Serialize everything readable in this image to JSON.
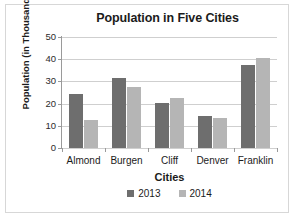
{
  "chart_data": {
    "type": "bar",
    "title": "Population in Five Cities",
    "xlabel": "Cities",
    "ylabel": "Population (in Thousands)",
    "categories": [
      "Almond",
      "Burgen",
      "Cliff",
      "Denver",
      "Franklin"
    ],
    "series": [
      {
        "name": "2013",
        "color": "#6e6e6e",
        "values": [
          24.5,
          31.5,
          20.5,
          14.5,
          37.5
        ]
      },
      {
        "name": "2014",
        "color": "#b5b5b5",
        "values": [
          12.5,
          27.5,
          22.5,
          13.5,
          40.5
        ]
      }
    ],
    "ylim": [
      0,
      50
    ],
    "yticks": [
      0,
      10,
      20,
      30,
      40,
      50
    ],
    "ytick_labels": [
      "0",
      "10",
      "20",
      "30",
      "40",
      "50"
    ],
    "grid": true,
    "legend_position": "bottom"
  }
}
